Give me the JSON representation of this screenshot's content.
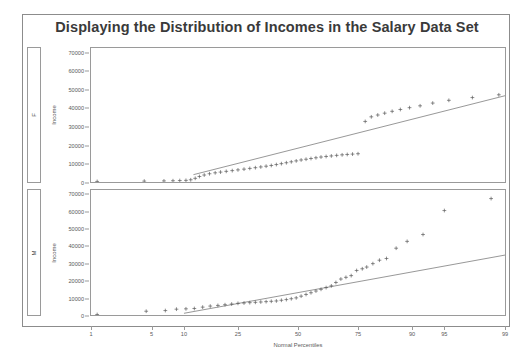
{
  "title": "Displaying the Distribution of Incomes in the Salary Data Set",
  "colors": {
    "frame": "#8c8c8c",
    "axis": "#9a9a9a",
    "marker": "#5a5a5a",
    "refline": "#6a6a6a",
    "title_text": "#3a3a3a",
    "tick_text": "#5a5a5a",
    "background": "#ffffff"
  },
  "axes": {
    "y_title": "Income",
    "x_title": "Normal Percentiles",
    "y_ticks": [
      "0",
      "10000",
      "20000",
      "30000",
      "40000",
      "50000",
      "60000",
      "70000"
    ],
    "x_ticks": [
      "1",
      "5",
      "10",
      "25",
      "50",
      "75",
      "90",
      "95",
      "99"
    ]
  },
  "panels": [
    {
      "strip_label": "F",
      "y_title": "Income"
    },
    {
      "strip_label": "M",
      "y_title": "Income"
    }
  ],
  "chart_data": {
    "type": "scatter",
    "title": "Displaying the Distribution of Incomes in the Salary Data Set",
    "subtitle": "",
    "xlabel": "Normal Percentiles",
    "ylabel": "Income",
    "plot_kind": "normal-probability-qq-plot",
    "grid": false,
    "legend": null,
    "xscale": "normal-probability",
    "x_tick_values": [
      1,
      5,
      10,
      25,
      50,
      75,
      90,
      95,
      99
    ],
    "ylim": [
      0,
      73000
    ],
    "y_tick_values": [
      0,
      10000,
      20000,
      30000,
      40000,
      50000,
      60000,
      70000
    ],
    "panels": [
      {
        "name": "F",
        "strip_label": "F",
        "marker": "plus",
        "reference_line": {
          "x_start": 12,
          "y_start": 4000,
          "x_end": 99,
          "y_end": 47000
        },
        "points": [
          {
            "x": 1.2,
            "y": 300
          },
          {
            "x": 4.2,
            "y": 500
          },
          {
            "x": 6.6,
            "y": 600
          },
          {
            "x": 8.0,
            "y": 700
          },
          {
            "x": 9.2,
            "y": 800
          },
          {
            "x": 10.4,
            "y": 900
          },
          {
            "x": 11.4,
            "y": 1200
          },
          {
            "x": 12.4,
            "y": 2000
          },
          {
            "x": 13.4,
            "y": 3000
          },
          {
            "x": 14.6,
            "y": 3800
          },
          {
            "x": 16.0,
            "y": 4500
          },
          {
            "x": 17.6,
            "y": 5000
          },
          {
            "x": 19.2,
            "y": 5400
          },
          {
            "x": 21.0,
            "y": 5800
          },
          {
            "x": 23.0,
            "y": 6200
          },
          {
            "x": 25.0,
            "y": 6600
          },
          {
            "x": 27.2,
            "y": 7000
          },
          {
            "x": 29.4,
            "y": 7400
          },
          {
            "x": 31.6,
            "y": 7800
          },
          {
            "x": 33.8,
            "y": 8200
          },
          {
            "x": 36.0,
            "y": 8600
          },
          {
            "x": 38.2,
            "y": 9000
          },
          {
            "x": 40.4,
            "y": 9500
          },
          {
            "x": 42.6,
            "y": 10000
          },
          {
            "x": 44.8,
            "y": 10500
          },
          {
            "x": 47.0,
            "y": 11000
          },
          {
            "x": 49.2,
            "y": 11500
          },
          {
            "x": 51.4,
            "y": 12000
          },
          {
            "x": 53.6,
            "y": 12400
          },
          {
            "x": 55.8,
            "y": 12800
          },
          {
            "x": 58.0,
            "y": 13200
          },
          {
            "x": 60.2,
            "y": 13600
          },
          {
            "x": 62.4,
            "y": 13900
          },
          {
            "x": 64.6,
            "y": 14200
          },
          {
            "x": 66.8,
            "y": 14500
          },
          {
            "x": 69.0,
            "y": 14800
          },
          {
            "x": 71.0,
            "y": 15000
          },
          {
            "x": 73.0,
            "y": 15200
          },
          {
            "x": 75.0,
            "y": 15400
          },
          {
            "x": 77.5,
            "y": 33000
          },
          {
            "x": 79.5,
            "y": 35500
          },
          {
            "x": 81.5,
            "y": 36500
          },
          {
            "x": 83.5,
            "y": 37500
          },
          {
            "x": 85.5,
            "y": 38500
          },
          {
            "x": 87.5,
            "y": 39500
          },
          {
            "x": 89.5,
            "y": 40500
          },
          {
            "x": 91.5,
            "y": 41500
          },
          {
            "x": 93.5,
            "y": 43000
          },
          {
            "x": 95.5,
            "y": 44500
          },
          {
            "x": 97.5,
            "y": 46000
          },
          {
            "x": 98.8,
            "y": 47500
          }
        ]
      },
      {
        "name": "M",
        "strip_label": "M",
        "marker": "plus",
        "reference_line": {
          "x_start": 10,
          "y_start": 1000,
          "x_end": 99,
          "y_end": 35000
        },
        "points": [
          {
            "x": 1.2,
            "y": 300
          },
          {
            "x": 4.4,
            "y": 2200
          },
          {
            "x": 6.8,
            "y": 2600
          },
          {
            "x": 8.6,
            "y": 3400
          },
          {
            "x": 10.4,
            "y": 3600
          },
          {
            "x": 12.2,
            "y": 3800
          },
          {
            "x": 14.2,
            "y": 4600
          },
          {
            "x": 16.2,
            "y": 5200
          },
          {
            "x": 18.4,
            "y": 5600
          },
          {
            "x": 20.6,
            "y": 6000
          },
          {
            "x": 22.8,
            "y": 6400
          },
          {
            "x": 25.0,
            "y": 6800
          },
          {
            "x": 27.2,
            "y": 7000
          },
          {
            "x": 29.4,
            "y": 7200
          },
          {
            "x": 31.6,
            "y": 7400
          },
          {
            "x": 33.8,
            "y": 7600
          },
          {
            "x": 36.0,
            "y": 7800
          },
          {
            "x": 38.2,
            "y": 8000
          },
          {
            "x": 40.4,
            "y": 8200
          },
          {
            "x": 42.6,
            "y": 8600
          },
          {
            "x": 44.8,
            "y": 9000
          },
          {
            "x": 47.0,
            "y": 9500
          },
          {
            "x": 49.2,
            "y": 10000
          },
          {
            "x": 51.4,
            "y": 11000
          },
          {
            "x": 53.6,
            "y": 12000
          },
          {
            "x": 55.8,
            "y": 13000
          },
          {
            "x": 58.0,
            "y": 14000
          },
          {
            "x": 60.2,
            "y": 15000
          },
          {
            "x": 62.4,
            "y": 16000
          },
          {
            "x": 64.6,
            "y": 17000
          },
          {
            "x": 66.5,
            "y": 19000
          },
          {
            "x": 68.5,
            "y": 21000
          },
          {
            "x": 70.5,
            "y": 22000
          },
          {
            "x": 72.5,
            "y": 23000
          },
          {
            "x": 74.5,
            "y": 26000
          },
          {
            "x": 76.5,
            "y": 27000
          },
          {
            "x": 78.0,
            "y": 28000
          },
          {
            "x": 80.0,
            "y": 30000
          },
          {
            "x": 82.0,
            "y": 32000
          },
          {
            "x": 84.0,
            "y": 33000
          },
          {
            "x": 86.5,
            "y": 39000
          },
          {
            "x": 89.0,
            "y": 43000
          },
          {
            "x": 92.0,
            "y": 47000
          },
          {
            "x": 95.0,
            "y": 61000
          },
          {
            "x": 98.5,
            "y": 68000
          }
        ]
      }
    ]
  }
}
